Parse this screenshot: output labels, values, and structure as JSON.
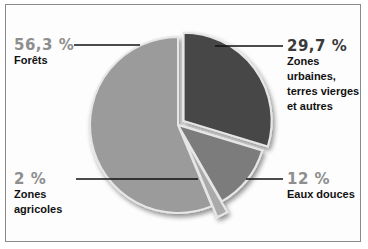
{
  "chart_data": {
    "type": "pie",
    "title": "",
    "start_angle_deg": 0,
    "direction": "clockwise",
    "slices": [
      {
        "label": "Zones urbaines, terres vierges et autres",
        "value": 29.7,
        "display": "29,7 %",
        "color": "#464646",
        "exploded": true
      },
      {
        "label": "Eaux douces",
        "value": 12,
        "display": "12 %",
        "color": "#7b7b7b",
        "exploded": false
      },
      {
        "label": "Zones agricoles",
        "value": 2,
        "display": "2 %",
        "color": "#aaaaaa",
        "exploded": true
      },
      {
        "label": "Forêts",
        "value": 56.3,
        "display": "56,3 %",
        "color": "#9b9b9b",
        "exploded": false
      }
    ],
    "legend": "none (callout labels with leader lines)"
  },
  "labels": {
    "forets": {
      "pct": "56,3 %",
      "name": "Forêts"
    },
    "urbaines": {
      "pct": "29,7 %",
      "name_lines": [
        "Zones urbaines,",
        "terres vierges",
        "et autres"
      ]
    },
    "agricoles": {
      "pct": "2 %",
      "name_lines": [
        "Zones",
        "agricoles"
      ]
    },
    "eaux": {
      "pct": "12 %",
      "name": "Eaux douces"
    }
  }
}
